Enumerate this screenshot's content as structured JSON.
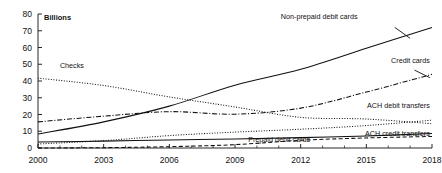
{
  "chart_data": {
    "type": "line",
    "title": "",
    "subtitle": "",
    "xlabel": "",
    "ylabel": "Billions",
    "unit_note": "Billions",
    "xlim": [
      2000,
      2018
    ],
    "ylim": [
      0,
      80
    ],
    "grid": false,
    "legend_position": "inline-annotations",
    "x_ticks": [
      "2000",
      "2003",
      "2006",
      "2009",
      "2012",
      "2015",
      "2018"
    ],
    "x_tick_values": [
      2000,
      2003,
      2006,
      2009,
      2012,
      2015,
      2018
    ],
    "x_minor_tick_values": [
      2001,
      2002,
      2004,
      2005,
      2007,
      2008,
      2010,
      2011,
      2013,
      2014,
      2016,
      2017
    ],
    "y_ticks": [
      "0",
      "10",
      "20",
      "30",
      "40",
      "50",
      "60",
      "70",
      "80"
    ],
    "y_tick_values": [
      0,
      10,
      20,
      30,
      40,
      50,
      60,
      70,
      80
    ],
    "x": [
      2000,
      2003,
      2006,
      2009,
      2012,
      2015,
      2018
    ],
    "series": [
      {
        "name": "Non-prepaid debit cards",
        "label": "Non-prepaid debit cards",
        "style": "solid",
        "color": "#111111",
        "values": [
          8.3,
          15.6,
          25.0,
          37.5,
          47.0,
          59.5,
          72.0
        ],
        "label_x": 2014.6,
        "label_y": 77.0,
        "label_anchor": "end"
      },
      {
        "name": "Checks",
        "label": "Checks",
        "style": "dotted",
        "color": "#111111",
        "values": [
          41.7,
          37.3,
          30.5,
          24.5,
          18.3,
          17.3,
          14.5
        ],
        "label_x": 2001.0,
        "label_y": 48.0,
        "label_anchor": "start"
      },
      {
        "name": "Credit cards",
        "label": "Credit cards",
        "style": "dash-dot",
        "color": "#111111",
        "values": [
          15.6,
          19.0,
          21.7,
          20.2,
          23.8,
          33.4,
          44.0
        ],
        "label_x": 2017.9,
        "label_y": 50.5,
        "label_anchor": "end"
      },
      {
        "name": "ACH debit transfers",
        "label": "ACH debit transfers",
        "style": "dotted",
        "color": "#111111",
        "values": [
          2.4,
          4.4,
          7.4,
          9.5,
          11.2,
          13.4,
          16.6
        ],
        "label_x": 2017.9,
        "label_y": 24.0,
        "label_anchor": "end"
      },
      {
        "name": "ACH credit transfers",
        "label": "ACH credit transfers",
        "style": "solid-thin",
        "color": "#111111",
        "values": [
          3.6,
          4.1,
          4.8,
          5.4,
          6.2,
          7.2,
          8.6
        ],
        "label_x": 2017.9,
        "label_y": 7.0,
        "label_anchor": "end"
      },
      {
        "name": "Prepaid debit cards",
        "label": "Prepaid debit cards",
        "style": "dashed",
        "color": "#111111",
        "values": [
          0.0,
          0.2,
          0.8,
          2.0,
          4.6,
          6.0,
          6.9
        ],
        "label_x": 2009.6,
        "label_y": 3.6,
        "label_anchor": "start"
      }
    ]
  },
  "plot_geometry": {
    "left": 38,
    "right": 432,
    "top": 14,
    "bottom": 148
  }
}
